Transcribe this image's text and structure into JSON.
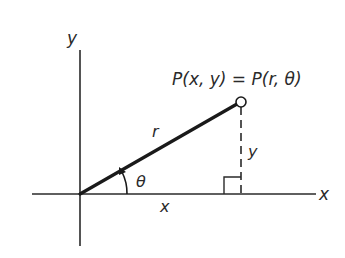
{
  "diagram": {
    "type": "polar-cartesian-coordinates",
    "axes": {
      "x_label": "x",
      "y_label": "y"
    },
    "point_label": "P(x, y) = P(r, θ)",
    "segment_labels": {
      "radius": "r",
      "angle": "θ",
      "horizontal_leg": "x",
      "vertical_leg": "y"
    },
    "colors": {
      "line": "#1a1a1a",
      "background": "#ffffff"
    }
  }
}
